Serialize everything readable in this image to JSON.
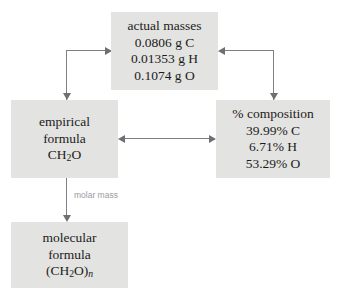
{
  "diagram": {
    "box_fill_color": "#e3e3e1",
    "arrow_color": "#7f8083",
    "text_color": "#1b1b1b",
    "label_color": "#9a9a9c",
    "background_color": "#ffffff"
  },
  "nodes": {
    "actual_masses": {
      "heading": "actual masses",
      "line1": "0.0806 g C",
      "line2": "0.01353 g H",
      "line3": "0.1074 g O"
    },
    "empirical_formula": {
      "line1": "empirical",
      "line2": "formula",
      "formula_prefix": "CH",
      "formula_sub": "2",
      "formula_suffix": "O"
    },
    "percent_composition": {
      "heading": "% composition",
      "line1": "39.99% C",
      "line2": "6.71% H",
      "line3": "53.29% O"
    },
    "molecular_formula": {
      "line1": "molecular",
      "line2": "formula",
      "formula_prefix": "(CH",
      "formula_sub": "2",
      "formula_mid": "O)",
      "formula_sub_n": "n"
    }
  },
  "edges": {
    "molar_mass_label": "molar mass"
  }
}
